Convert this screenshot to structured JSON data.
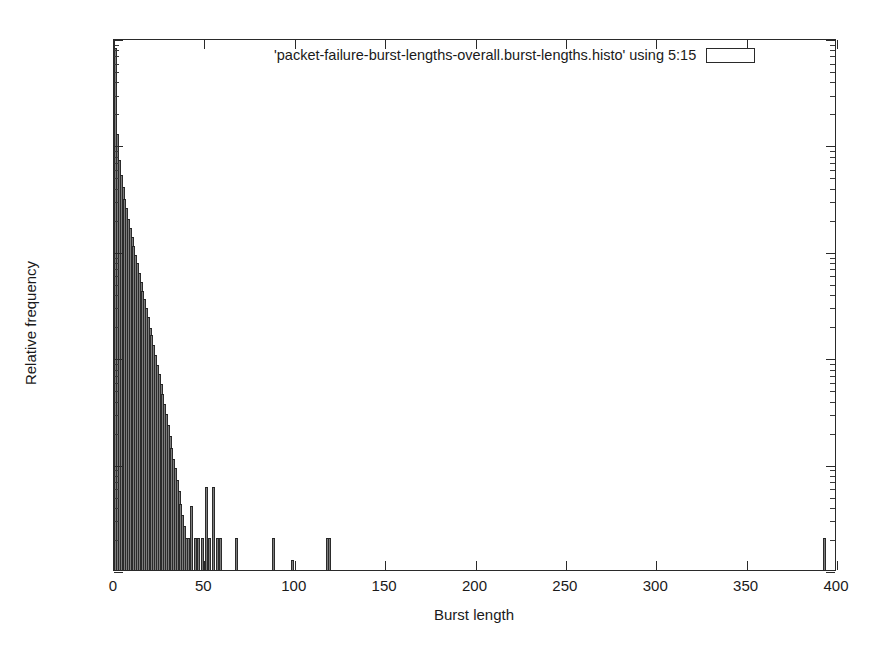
{
  "chart_data": {
    "type": "bar",
    "title": "",
    "subtitle": "",
    "xlabel": "Burst length",
    "ylabel": "Relative frequency",
    "xlim": [
      0,
      400
    ],
    "ylim": [
      1e-05,
      1
    ],
    "yscale": "log",
    "xscale": "linear",
    "grid": false,
    "legend_position": "top-right-inside",
    "xticks": [
      0,
      50,
      100,
      150,
      200,
      250,
      300,
      350,
      400
    ],
    "xticklabels": [
      "0",
      "50",
      "100",
      "150",
      "200",
      "250",
      "300",
      "350",
      "400"
    ],
    "yticks": [
      1,
      0.1,
      0.01,
      0.001,
      0.0001,
      1e-05
    ],
    "yticklabels": [
      "1",
      "0.1",
      "0.01",
      "0.001",
      "1e-04",
      "1e-05"
    ],
    "series": [
      {
        "name": "'packet-failure-burst-lengths-overall.burst-lengths.histo' using 5:15",
        "x": [
          1,
          2,
          3,
          4,
          5,
          6,
          7,
          8,
          9,
          10,
          11,
          12,
          13,
          14,
          15,
          16,
          17,
          18,
          19,
          20,
          21,
          22,
          23,
          24,
          25,
          26,
          27,
          28,
          29,
          30,
          31,
          32,
          33,
          34,
          35,
          36,
          37,
          38,
          39,
          40,
          41,
          43,
          45,
          47,
          49,
          51,
          53,
          55,
          57,
          59,
          68,
          88,
          99,
          118,
          119,
          393
        ],
        "values": [
          0.8,
          0.125,
          0.072,
          0.052,
          0.04,
          0.031,
          0.025,
          0.02,
          0.0165,
          0.0135,
          0.0112,
          0.0092,
          0.0076,
          0.0062,
          0.0051,
          0.0042,
          0.0035,
          0.0029,
          0.0024,
          0.0019,
          0.0016,
          0.0013,
          0.00105,
          0.00085,
          0.0007,
          0.00056,
          0.00045,
          0.00036,
          0.00029,
          0.00023,
          0.00018,
          0.00014,
          0.00011,
          9e-05,
          7e-05,
          5.5e-05,
          4.2e-05,
          3.3e-05,
          2.6e-05,
          2e-05,
          2e-05,
          4e-05,
          2e-05,
          2e-05,
          2e-05,
          6e-05,
          2e-05,
          6e-05,
          2e-05,
          2e-05,
          2e-05,
          2e-05,
          1.25e-05,
          2e-05,
          2e-05,
          2e-05
        ]
      }
    ]
  },
  "legend": {
    "entry_label": "'packet-failure-burst-lengths-overall.burst-lengths.histo' using 5:15",
    "key_icon": "empty-box-icon"
  },
  "axes": {
    "x_title": "Burst length",
    "y_title": "Relative frequency"
  },
  "colors": {
    "bar_fill": "#7d7d7d",
    "bar_edge": "#2b2b2b",
    "axis": "#2a2a2a",
    "text": "#1a1a1a",
    "background": "#ffffff"
  }
}
